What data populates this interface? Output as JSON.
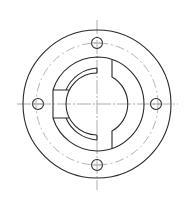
{
  "drawing": {
    "title": "Flange front view",
    "colors": {
      "line": "#2a2a2a",
      "bolt_circle": "#b5b5b5",
      "centerline": "#8a8a8a",
      "background": "#ffffff"
    },
    "center": [
      97,
      104
    ],
    "outer_radius": 74,
    "bolt_circle_radius": 61,
    "bolt_hole_radius": 5.5,
    "bolt_holes": [
      [
        97,
        43
      ],
      [
        156,
        104
      ],
      [
        97,
        165
      ],
      [
        38,
        104
      ]
    ],
    "hub_radius": 47,
    "counterbore_radius": 36,
    "bore_radius": 31,
    "keyway_x": 112,
    "notch": {
      "x": 53,
      "y": 90,
      "w": 16,
      "h": 28
    }
  }
}
